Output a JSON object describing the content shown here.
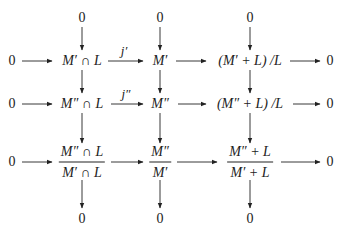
{
  "diagram": {
    "type": "commutative-diagram",
    "zeros": {
      "top_col1": "0",
      "top_col2": "0",
      "top_col3": "0",
      "left_row1": "0",
      "left_row2": "0",
      "left_row3": "0",
      "right_row1": "0",
      "right_row2": "0",
      "right_row3": "0",
      "bottom_col1": "0",
      "bottom_col2": "0",
      "bottom_col3": "0"
    },
    "row1": {
      "col1": "M′ ∩ L",
      "col2": "M′",
      "col3": "(M′ + L) /L"
    },
    "row2": {
      "col1": "M″ ∩ L",
      "col2": "M″",
      "col3": "(M″ + L) /L"
    },
    "row3": {
      "col1_num": "M″ ∩ L",
      "col1_den": "M′ ∩ L",
      "col2_num": "M″",
      "col2_den": "M′",
      "col3_num": "M″ + L",
      "col3_den": "M′ + L"
    },
    "arrow_labels": {
      "row1_col1_to_col2": "j′",
      "row2_col1_to_col2": "j″"
    },
    "stroke_color": "#222222"
  }
}
